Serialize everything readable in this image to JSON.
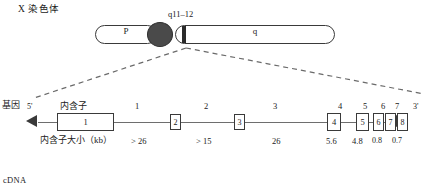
{
  "figure": {
    "chromosome_title": "X 染色体",
    "gene_label": "基因",
    "cdna_label": "cDNA"
  },
  "ideogram": {
    "band_label": "q11–12",
    "p_arm_label": "P",
    "q_arm_label": "q",
    "centromere_color": "#4a4a4a",
    "band_color": "#2b2b2b",
    "outline_color": "#3a3a3a"
  },
  "gene_map": {
    "five_prime": "5'",
    "three_prime": "3'",
    "intron_row_label": "内含子",
    "intron_size_label": "内含子大小（kb）",
    "exons": [
      {
        "id": "1",
        "label": "1"
      },
      {
        "id": "2",
        "label": "2"
      },
      {
        "id": "3",
        "label": "3"
      },
      {
        "id": "4",
        "label": "4"
      },
      {
        "id": "5",
        "label": "5"
      },
      {
        "id": "6",
        "label": "6"
      },
      {
        "id": "7",
        "label": "7"
      },
      {
        "id": "8",
        "label": "8"
      }
    ],
    "intron_numbers": [
      "1",
      "2",
      "3",
      "4",
      "5",
      "6",
      "7"
    ],
    "intron_sizes": [
      "> 26",
      "> 15",
      "26",
      "5.6",
      "4.8",
      "0.8",
      "0.7"
    ]
  }
}
